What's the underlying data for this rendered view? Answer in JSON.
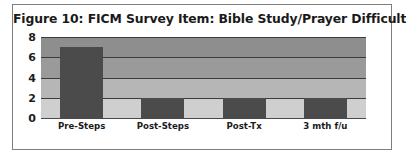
{
  "figure": {
    "title": "Figure 10: FICM Survey Item: Bible Study/Prayer Difficulties",
    "frame_color": "#7e7e7e",
    "background_color": "#ffffff"
  },
  "chart_data": {
    "type": "bar",
    "title": "Figure 10: FICM Survey Item: Bible Study/Prayer Difficulties",
    "categories": [
      "Pre-Steps",
      "Post-Steps",
      "Post-Tx",
      "3 mth f/u"
    ],
    "values": [
      7,
      2,
      2,
      2
    ],
    "series": [
      {
        "name": "Bible Study/Prayer Difficulties",
        "values": [
          7,
          2,
          2,
          2
        ]
      }
    ],
    "xlabel": "",
    "ylabel": "",
    "ylim": [
      0,
      8
    ],
    "ytick_labels": [
      "8",
      "6",
      "4",
      "2",
      "0"
    ],
    "ytick_values": [
      8,
      6,
      4,
      2,
      0
    ],
    "grid": true,
    "grid_orientation": "horizontal",
    "legend": false,
    "legend_position": "none",
    "bar_color": "#4b4b4b",
    "plot_background_bands": [
      "#8e8e8e",
      "#9a9a9a",
      "#b6b6b6",
      "#cfcfcf"
    ],
    "gridline_color": "#3c3c3c",
    "axis_color": "#4a4a4a"
  }
}
